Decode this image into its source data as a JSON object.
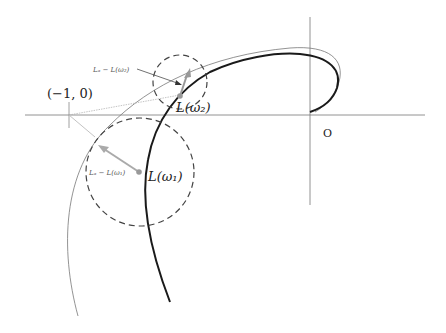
{
  "diagram": {
    "labels": {
      "critical_point": "(−1, 0)",
      "origin": "O",
      "point_w1": "L(ω₁)",
      "point_w2": "L(ω₂)",
      "vector_w1": "Lₐ − L(ω₁)",
      "vector_w2": "Lₐ − L(ω₂)"
    },
    "axes": {
      "real_axis": "horizontal",
      "imag_axis": "vertical"
    },
    "curves": [
      {
        "name": "nominal-nyquist-curve",
        "style": "bold black"
      },
      {
        "name": "perturbed-nyquist-curve",
        "style": "thin gray"
      }
    ],
    "circles": [
      {
        "name": "uncertainty-disk-w1",
        "style": "dashed"
      },
      {
        "name": "uncertainty-disk-w2",
        "style": "dashed"
      }
    ],
    "colors": {
      "axis": "#777777",
      "bold_curve": "#1a1a1a",
      "thin_curve": "#777777",
      "vector": "#999999",
      "dashed": "#444444"
    }
  }
}
